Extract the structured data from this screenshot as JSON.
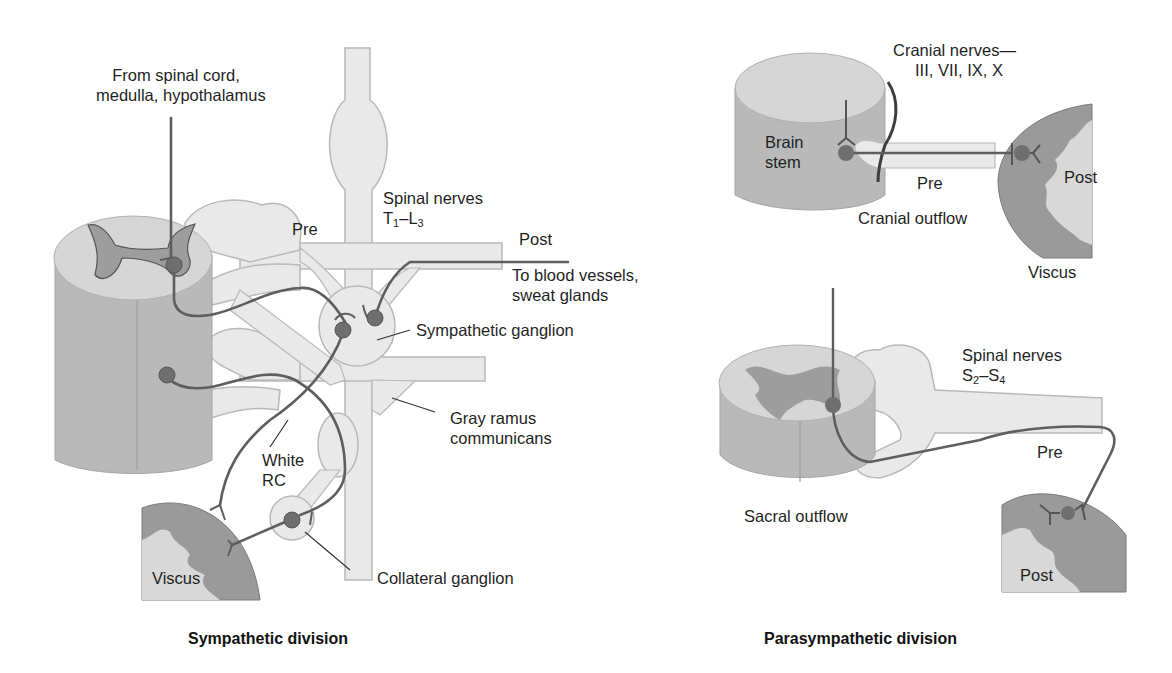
{
  "colors": {
    "background": "#ffffff",
    "nerve_fill": "#e9e9e9",
    "nerve_outline": "#b8b8b8",
    "cord_body": "#b9b9b9",
    "cord_top": "#d6d6d6",
    "gray_matter": "#9d9d9d",
    "neuron_body": "#6f6f6f",
    "fiber": "#5e5e5e",
    "viscus_outer": "#9a9a9a",
    "viscus_inner": "#d8d8d8"
  },
  "sympathetic": {
    "title": "Sympathetic division",
    "labels": {
      "origin_line1": "From spinal cord,",
      "origin_line2": "medulla, hypothalamus",
      "pre": "Pre",
      "spinal_nerves": "Spinal nerves",
      "spinal_range_start": "T",
      "spinal_range_start_sub": "1",
      "spinal_range_dash": "–L",
      "spinal_range_end_sub": "3",
      "post": "Post",
      "target_line1": "To blood vessels,",
      "target_line2": "sweat glands",
      "sympathetic_ganglion": "Sympathetic ganglion",
      "gray_ramus_line1": "Gray ramus",
      "gray_ramus_line2": "communicans",
      "white_rc_line1": "White",
      "white_rc_line2": "RC",
      "collateral_ganglion": "Collateral ganglion",
      "viscus": "Viscus"
    }
  },
  "parasympathetic": {
    "title": "Parasympathetic division",
    "cranial": {
      "nerves_line1": "Cranial nerves—",
      "nerves_line2": "III, VII, IX, X",
      "brain_stem_line1": "Brain",
      "brain_stem_line2": "stem",
      "pre": "Pre",
      "post": "Post",
      "outflow": "Cranial outflow",
      "viscus": "Viscus"
    },
    "sacral": {
      "spinal_nerves": "Spinal nerves",
      "range_start": "S",
      "range_start_sub": "2",
      "range_dash": "–S",
      "range_end_sub": "4",
      "pre": "Pre",
      "post": "Post",
      "outflow": "Sacral outflow"
    }
  }
}
